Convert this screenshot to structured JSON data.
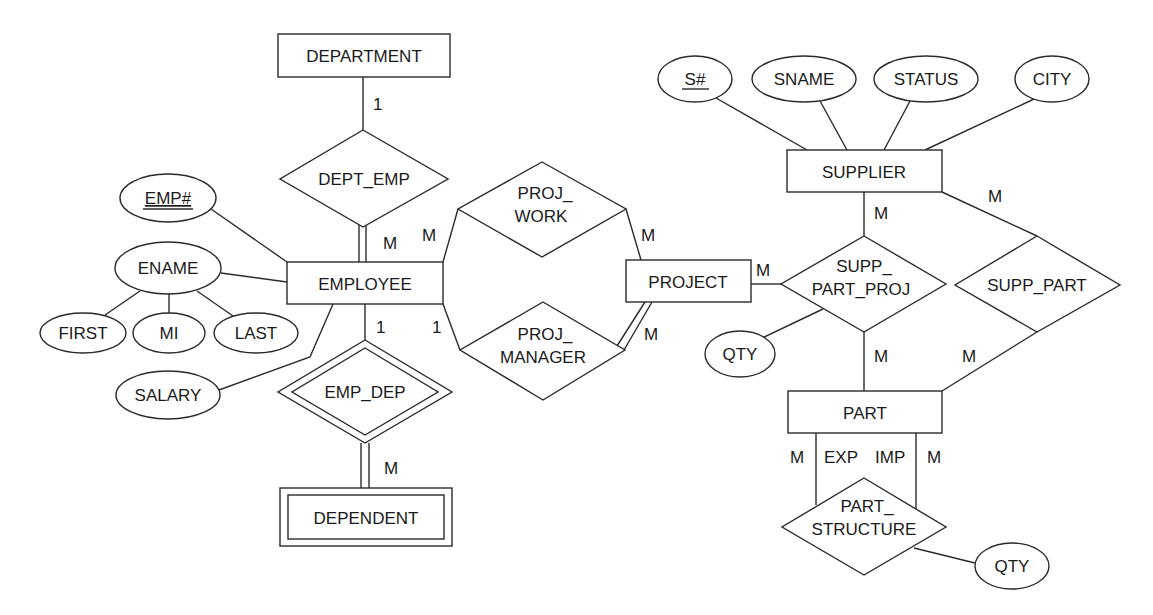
{
  "diagram": {
    "type": "ER diagram",
    "entities": {
      "department": {
        "label": "DEPARTMENT",
        "weak": false
      },
      "employee": {
        "label": "EMPLOYEE",
        "weak": false
      },
      "dependent": {
        "label": "DEPENDENT",
        "weak": true
      },
      "project": {
        "label": "PROJECT",
        "weak": false
      },
      "supplier": {
        "label": "SUPPLIER",
        "weak": false
      },
      "part": {
        "label": "PART",
        "weak": false
      }
    },
    "relationships": {
      "dept_emp": {
        "label": "DEPT_EMP"
      },
      "emp_dep": {
        "label": "EMP_DEP",
        "identifying": true
      },
      "proj_work": {
        "line1": "PROJ_",
        "line2": "WORK"
      },
      "proj_manager": {
        "line1": "PROJ_",
        "line2": "MANAGER"
      },
      "supp_part_proj": {
        "line1": "SUPP_",
        "line2": "PART_PROJ"
      },
      "supp_part": {
        "label": "SUPP_PART"
      },
      "part_structure": {
        "line1": "PART_",
        "line2": "STRUCTURE"
      }
    },
    "attributes": {
      "emp_no": {
        "label": "EMP#",
        "key": true
      },
      "ename": {
        "label": "ENAME"
      },
      "first": {
        "label": "FIRST"
      },
      "mi": {
        "label": "MI"
      },
      "last": {
        "label": "LAST"
      },
      "salary": {
        "label": "SALARY"
      },
      "s_no": {
        "label": "S#",
        "key": true
      },
      "sname": {
        "label": "SNAME"
      },
      "status": {
        "label": "STATUS"
      },
      "city": {
        "label": "CITY"
      },
      "qty_spp": {
        "label": "QTY"
      },
      "qty_ps": {
        "label": "QTY"
      }
    },
    "cardinalities": {
      "dept_side": "1",
      "dept_emp_emp_side": "M",
      "proj_work_emp_side": "M",
      "proj_work_proj_side": "M",
      "proj_mgr_emp_side": "1",
      "proj_mgr_proj_side": "M",
      "emp_dep_emp_side": "1",
      "emp_dep_dep_side": "M",
      "spp_proj_side": "M",
      "spp_supplier_side": "M",
      "spp_part_side": "M",
      "sp_supplier_side": "M",
      "sp_part_side": "M",
      "ps_left_card": "M",
      "ps_right_card": "M",
      "ps_left_role": "EXP",
      "ps_right_role": "IMP"
    }
  }
}
